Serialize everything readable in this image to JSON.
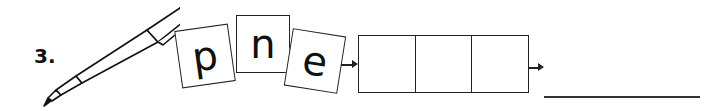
{
  "item_number": "3.",
  "picture": "pen",
  "letter_tiles": [
    "p",
    "n",
    "e"
  ],
  "answer_boxes": 3,
  "answer_line": ""
}
